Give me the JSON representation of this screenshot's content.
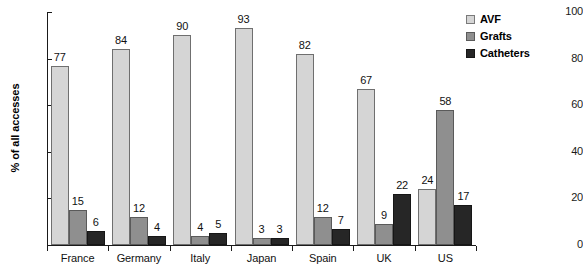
{
  "chart_data": {
    "type": "bar",
    "title": "",
    "subtitle": "",
    "xlabel": "",
    "ylabel": "% of all accesses",
    "ylim": [
      0,
      100
    ],
    "yticks": [
      0,
      20,
      40,
      60,
      80,
      100
    ],
    "grid": false,
    "legend_position": "top-right",
    "categories": [
      "France",
      "Germany",
      "Italy",
      "Japan",
      "Spain",
      "UK",
      "US"
    ],
    "series": [
      {
        "name": "AVF",
        "color": "#d5d5d5",
        "values": [
          77,
          84,
          90,
          93,
          82,
          67,
          24
        ]
      },
      {
        "name": "Grafts",
        "color": "#8f8f8f",
        "values": [
          15,
          12,
          4,
          3,
          12,
          9,
          58
        ]
      },
      {
        "name": "Catheters",
        "color": "#262626",
        "values": [
          6,
          4,
          5,
          3,
          7,
          22,
          17
        ]
      }
    ]
  },
  "axis": {
    "y_title": "% of all accesses",
    "y_tick_labels": [
      "0",
      "20",
      "40",
      "60",
      "80",
      "100"
    ]
  },
  "legend": {
    "items": [
      {
        "label": "AVF"
      },
      {
        "label": "Grafts"
      },
      {
        "label": "Catheters"
      }
    ]
  },
  "colors": {
    "avf": "#d5d5d5",
    "grafts": "#8f8f8f",
    "catheters": "#262626",
    "axis": "#1a1a1a",
    "background": "#ffffff"
  }
}
